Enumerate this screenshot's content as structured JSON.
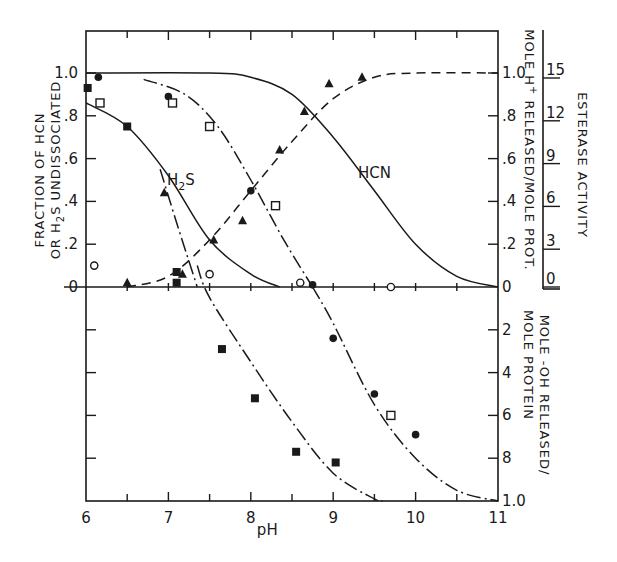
{
  "chart_data": {
    "type": "scatter",
    "title": "",
    "xlabel": "pH",
    "x_ticks": [
      "6",
      "7",
      "8",
      "9",
      "10",
      "11"
    ],
    "xlim": [
      6,
      11
    ],
    "upper_panel": {
      "ylabel_line1": "FRACTION OF HCN",
      "ylabel_line2": "OR H2S UNDISSOCIATED",
      "ylim": [
        0,
        1.0
      ],
      "y_ticks_left": [
        "0",
        ".2",
        ".4",
        ".6",
        ".8",
        "1.0"
      ],
      "y_ticks_right": [
        "0",
        ".2",
        ".4",
        ".6",
        ".8",
        "1.0"
      ],
      "right_ylabel": "MOLE H+ RELEASED/MOLE PROT.",
      "far_right_axis": {
        "label": "ESTERASE ACTIVITY",
        "ticks": [
          "0",
          "3",
          "6",
          "9",
          "12",
          "15"
        ]
      },
      "curve_labels": [
        "H2S",
        "HCN"
      ],
      "curves": [
        {
          "name": "HCN undissociated",
          "style": "solid",
          "x": [
            6.0,
            7.5,
            8.0,
            8.5,
            9.0,
            9.5,
            10.0,
            10.5,
            11.0
          ],
          "y": [
            1.0,
            1.0,
            0.98,
            0.9,
            0.7,
            0.45,
            0.2,
            0.05,
            0.0
          ]
        },
        {
          "name": "H2S undissociated",
          "style": "solid",
          "x": [
            6.0,
            6.5,
            7.0,
            7.5,
            8.0,
            8.35
          ],
          "y": [
            0.86,
            0.75,
            0.52,
            0.22,
            0.06,
            0.0
          ]
        },
        {
          "name": "H+ released",
          "style": "dashed",
          "x": [
            6.5,
            7.0,
            7.5,
            8.0,
            8.5,
            9.0,
            9.5,
            10.0,
            11.0
          ],
          "y": [
            0.0,
            0.05,
            0.22,
            0.45,
            0.68,
            0.88,
            0.98,
            1.0,
            1.0
          ]
        }
      ],
      "series": [
        {
          "name": "filled-circle",
          "marker": "filled-circle",
          "points": [
            [
              6.15,
              0.98
            ],
            [
              7.0,
              0.89
            ],
            [
              8.0,
              0.45
            ],
            [
              8.75,
              0.01
            ]
          ]
        },
        {
          "name": "open-square",
          "marker": "open-square",
          "points": [
            [
              6.17,
              0.86
            ],
            [
              7.05,
              0.86
            ],
            [
              7.5,
              0.75
            ],
            [
              8.3,
              0.38
            ]
          ]
        },
        {
          "name": "filled-square",
          "marker": "filled-square",
          "points": [
            [
              6.02,
              0.93
            ],
            [
              6.5,
              0.75
            ],
            [
              7.1,
              0.07
            ],
            [
              7.1,
              0.02
            ]
          ]
        },
        {
          "name": "filled-triangle",
          "marker": "filled-triangle",
          "points": [
            [
              6.5,
              0.02
            ],
            [
              6.95,
              0.44
            ],
            [
              7.17,
              0.06
            ],
            [
              7.55,
              0.22
            ],
            [
              7.9,
              0.31
            ],
            [
              8.35,
              0.64
            ],
            [
              8.65,
              0.82
            ],
            [
              8.95,
              0.95
            ],
            [
              9.35,
              0.98
            ]
          ]
        },
        {
          "name": "open-circle",
          "marker": "open-circle",
          "points": [
            [
              6.1,
              0.1
            ],
            [
              7.5,
              0.06
            ],
            [
              8.6,
              0.02
            ],
            [
              9.7,
              0.0
            ]
          ]
        }
      ]
    },
    "lower_panel": {
      "ylabel": "MOLE -OH RELEASED/ MOLE PROTEIN",
      "ylim": [
        0,
        1.0
      ],
      "y_ticks_right": [
        "2",
        "4",
        "6",
        "8",
        "1.0"
      ],
      "curves": [
        {
          "name": "OH- released (H2S)",
          "style": "dash-dot",
          "x": [
            7.35,
            7.5,
            8.0,
            8.5,
            9.0,
            9.5,
            9.6
          ],
          "y": [
            -0.1,
            0.05,
            0.35,
            0.63,
            0.87,
            0.99,
            1.0
          ]
        },
        {
          "name": "OH- released (HCN)",
          "style": "dash-dot",
          "x": [
            8.75,
            9.0,
            9.5,
            10.0,
            10.5,
            11.0
          ],
          "y": [
            0.0,
            0.17,
            0.55,
            0.8,
            0.95,
            1.0
          ]
        }
      ],
      "series": [
        {
          "name": "filled-square",
          "marker": "filled-square",
          "points": [
            [
              7.65,
              0.29
            ],
            [
              8.05,
              0.52
            ],
            [
              8.55,
              0.77
            ],
            [
              9.03,
              0.82
            ]
          ]
        },
        {
          "name": "filled-circle",
          "marker": "filled-circle",
          "points": [
            [
              9.0,
              0.24
            ],
            [
              9.5,
              0.5
            ],
            [
              10.0,
              0.69
            ]
          ]
        },
        {
          "name": "open-square",
          "marker": "open-square",
          "points": [
            [
              9.7,
              0.6
            ]
          ]
        }
      ]
    }
  },
  "labels": {
    "xlabel": "pH",
    "h2s": "H",
    "h2s_sub": "2",
    "h2s_tail": "S",
    "hcn": "HCN",
    "left_title_1": "FRACTION OF HCN",
    "left_title_2a": "OR H",
    "left_title_2sub": "2",
    "left_title_2b": "S UNDISSOCIATED",
    "right_title_upper_a": "MOLE H",
    "right_title_upper_sup": "+",
    "right_title_upper_b": " RELEASED/MOLE PROT.",
    "right_title_lower_1": "MOLE -OH RELEASED/",
    "right_title_lower_2": "MOLE PROTEIN",
    "esterase_title": "ESTERASE ACTIVITY"
  }
}
